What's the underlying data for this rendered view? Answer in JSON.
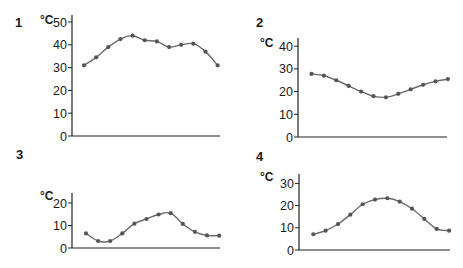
{
  "chart_data": [
    {
      "type": "line",
      "panel": "1",
      "title": "",
      "ylabel": "°C",
      "xlabel": "",
      "ylim": [
        0,
        50
      ],
      "yticks": [
        0,
        10,
        20,
        30,
        40,
        50
      ],
      "ytick_labels": [
        "0",
        "10",
        "20",
        "30",
        "40",
        "50"
      ],
      "grid": false,
      "series": [
        {
          "name": "temperature",
          "values": [
            31,
            34.5,
            39,
            42.5,
            44,
            42,
            41.5,
            39,
            40,
            40.5,
            37,
            31
          ]
        }
      ]
    },
    {
      "type": "line",
      "panel": "2",
      "title": "",
      "ylabel": "°C",
      "xlabel": "",
      "ylim": [
        0,
        40
      ],
      "yticks": [
        0,
        10,
        20,
        30,
        40
      ],
      "ytick_labels": [
        "0",
        "10",
        "20",
        "30",
        "40"
      ],
      "grid": false,
      "series": [
        {
          "name": "temperature",
          "values": [
            27.8,
            27,
            25,
            22.5,
            20,
            18,
            17.5,
            19,
            21,
            23,
            24.5,
            25.5
          ]
        }
      ]
    },
    {
      "type": "line",
      "panel": "3",
      "title": "",
      "ylabel": "°C",
      "xlabel": "",
      "ylim": [
        0,
        20
      ],
      "yticks": [
        0,
        10,
        20
      ],
      "ytick_labels": [
        "0",
        "10",
        "20"
      ],
      "grid": false,
      "series": [
        {
          "name": "temperature",
          "values": [
            6.5,
            3.1,
            3.1,
            6.5,
            10.8,
            12.9,
            14.9,
            15.5,
            10.7,
            7.2,
            5.6,
            5.5
          ]
        }
      ]
    },
    {
      "type": "line",
      "panel": "4",
      "title": "",
      "ylabel": "°C",
      "xlabel": "",
      "ylim": [
        0,
        30
      ],
      "yticks": [
        0,
        10,
        20,
        30
      ],
      "ytick_labels": [
        "0",
        "10",
        "20",
        "30"
      ],
      "grid": false,
      "series": [
        {
          "name": "temperature",
          "values": [
            7.1,
            8.7,
            11.7,
            15.9,
            20.6,
            22.7,
            23.3,
            21.8,
            18.6,
            14,
            9.5,
            8.7
          ]
        }
      ]
    }
  ],
  "colors": {
    "line": "#6a6a6a",
    "marker": "#555555",
    "axis": "#222222",
    "text": "#1a1a1a"
  }
}
